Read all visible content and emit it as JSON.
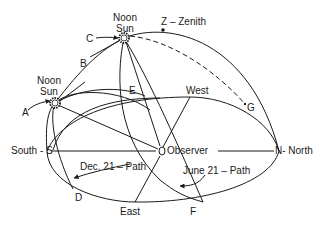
{
  "diagram": {
    "type": "celestial-sphere-sun-paths",
    "labels": {
      "noon_sun_upper": [
        "Noon",
        "Sun"
      ],
      "noon_sun_lower": [
        "Noon",
        "Sun"
      ],
      "zenith": "Z – Zenith",
      "point_a": "A",
      "point_b": "B",
      "point_c": "C",
      "point_d": "D",
      "point_e": "E",
      "point_f": "F",
      "point_g": "G",
      "west": "West",
      "east": "East",
      "south": "South - S",
      "north": "N- North",
      "observer": "Observer",
      "dec21_path": "Dec. 21 – Path",
      "june21_path": "June 21 – Path"
    },
    "colors": {
      "line": "#1a1a1a",
      "background": "#ffffff"
    }
  }
}
